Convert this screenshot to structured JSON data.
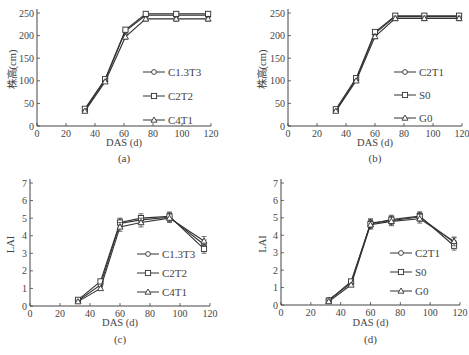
{
  "chart_data": [
    {
      "panel": "(a)",
      "type": "line",
      "caption": "(a)",
      "xlabel": "DAS (d)",
      "ylabel": "株高(cm)",
      "xlim": [
        0,
        120
      ],
      "ylim": [
        0,
        250
      ],
      "xticks": [
        0,
        20,
        40,
        60,
        80,
        100,
        120
      ],
      "yticks": [
        0,
        50,
        100,
        150,
        200,
        250
      ],
      "grid": false,
      "legend_position": "center-right",
      "x": [
        33,
        47,
        61,
        75,
        96,
        118
      ],
      "series": [
        {
          "name": "C1.3T3",
          "marker": "circle",
          "values": [
            35,
            102,
            210,
            245,
            245,
            245
          ]
        },
        {
          "name": "C2T2",
          "marker": "square",
          "values": [
            38,
            104,
            213,
            248,
            248,
            248
          ]
        },
        {
          "name": "C4T1",
          "marker": "triangle",
          "values": [
            33,
            98,
            197,
            237,
            237,
            237
          ]
        }
      ]
    },
    {
      "panel": "(b)",
      "type": "line",
      "caption": "(b)",
      "xlabel": "DAS (d)",
      "ylabel": "株高(cm)",
      "xlim": [
        0,
        120
      ],
      "ylim": [
        0,
        250
      ],
      "xticks": [
        0,
        20,
        40,
        60,
        80,
        100,
        120
      ],
      "yticks": [
        0,
        50,
        100,
        150,
        200,
        250
      ],
      "grid": false,
      "legend_position": "center-right",
      "x": [
        33,
        47,
        60,
        74,
        94,
        118
      ],
      "series": [
        {
          "name": "C2T1",
          "marker": "circle",
          "values": [
            35,
            103,
            205,
            242,
            242,
            242
          ]
        },
        {
          "name": "S0",
          "marker": "square",
          "values": [
            37,
            106,
            208,
            244,
            244,
            244
          ]
        },
        {
          "name": "G0",
          "marker": "triangle",
          "values": [
            33,
            100,
            198,
            238,
            238,
            238
          ]
        }
      ]
    },
    {
      "panel": "(c)",
      "type": "line",
      "caption": "(c)",
      "xlabel": "DAS (d)",
      "ylabel": "LAI",
      "xlim": [
        0,
        120
      ],
      "ylim": [
        0,
        7
      ],
      "xticks": [
        0,
        20,
        40,
        60,
        80,
        100,
        120
      ],
      "yticks": [
        0,
        1,
        2,
        3,
        4,
        5,
        6,
        7
      ],
      "grid": false,
      "legend_position": "center-right",
      "x": [
        32,
        47,
        60,
        74,
        93,
        116
      ],
      "series": [
        {
          "name": "C1.3T3",
          "marker": "circle",
          "values": [
            0.3,
            1.2,
            4.7,
            4.9,
            5.05,
            3.5
          ]
        },
        {
          "name": "C2T2",
          "marker": "square",
          "values": [
            0.35,
            1.4,
            4.75,
            5.0,
            5.1,
            3.25
          ]
        },
        {
          "name": "C4T1",
          "marker": "triangle",
          "values": [
            0.25,
            1.0,
            4.5,
            4.75,
            5.0,
            3.7
          ]
        }
      ]
    },
    {
      "panel": "(d)",
      "type": "line",
      "caption": "(d)",
      "xlabel": "DAS (d)",
      "ylabel": "LAI",
      "xlim": [
        0,
        120
      ],
      "ylim": [
        0,
        7
      ],
      "xticks": [
        0,
        20,
        40,
        60,
        80,
        100,
        120
      ],
      "yticks": [
        0,
        1,
        2,
        3,
        4,
        5,
        6,
        7
      ],
      "grid": false,
      "legend_position": "center-right",
      "x": [
        32,
        47,
        60,
        74,
        93,
        116
      ],
      "series": [
        {
          "name": "C2T1",
          "marker": "circle",
          "values": [
            0.3,
            1.25,
            4.7,
            4.85,
            5.05,
            3.6
          ]
        },
        {
          "name": "S0",
          "marker": "square",
          "values": [
            0.25,
            1.35,
            4.65,
            4.9,
            5.1,
            3.4
          ]
        },
        {
          "name": "G0",
          "marker": "triangle",
          "values": [
            0.2,
            1.15,
            4.6,
            4.8,
            4.95,
            3.65
          ]
        }
      ]
    }
  ],
  "layout": {
    "panels": [
      {
        "x0": 37,
        "x1": 211,
        "y0": 126,
        "y1": 13,
        "legend": {
          "x": 143,
          "y": 72,
          "dy": 24
        },
        "cap_y": 162,
        "xlabel_y": 146,
        "ylabel_x": 12
      },
      {
        "x0": 288,
        "x1": 462,
        "y0": 126,
        "y1": 13,
        "legend": {
          "x": 394,
          "y": 72,
          "dy": 23
        },
        "cap_y": 162,
        "xlabel_y": 146,
        "ylabel_x": 262
      },
      {
        "x0": 30,
        "x1": 210,
        "y0": 306,
        "y1": 183,
        "legend": {
          "x": 137,
          "y": 254,
          "dy": 19
        },
        "cap_y": 343,
        "xlabel_y": 326,
        "ylabel_x": 10
      },
      {
        "x0": 281,
        "x1": 460,
        "y0": 305,
        "y1": 183,
        "legend": {
          "x": 390,
          "y": 253,
          "dy": 19
        },
        "cap_y": 343,
        "xlabel_y": 326,
        "ylabel_x": 262
      }
    ],
    "line_color": "#333333"
  }
}
